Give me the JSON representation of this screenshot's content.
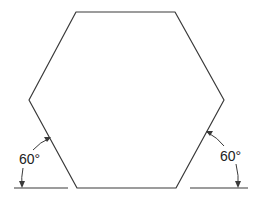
{
  "diagram": {
    "type": "regular-hexagon",
    "stroke_color": "#3a3a3a",
    "background": "#ffffff",
    "vertices": [
      [
        76,
        12
      ],
      [
        175,
        12
      ],
      [
        224,
        100
      ],
      [
        176,
        188
      ],
      [
        77,
        188
      ],
      [
        29,
        100
      ]
    ],
    "annotations": [
      {
        "id": "left-angle",
        "text": "60°",
        "side": "left"
      },
      {
        "id": "right-angle",
        "text": "60°",
        "side": "right"
      }
    ],
    "baselines": [
      {
        "from": [
          14,
          188
        ],
        "to": [
          68,
          188
        ]
      },
      {
        "from": [
          190,
          188
        ],
        "to": [
          248,
          188
        ]
      }
    ]
  }
}
